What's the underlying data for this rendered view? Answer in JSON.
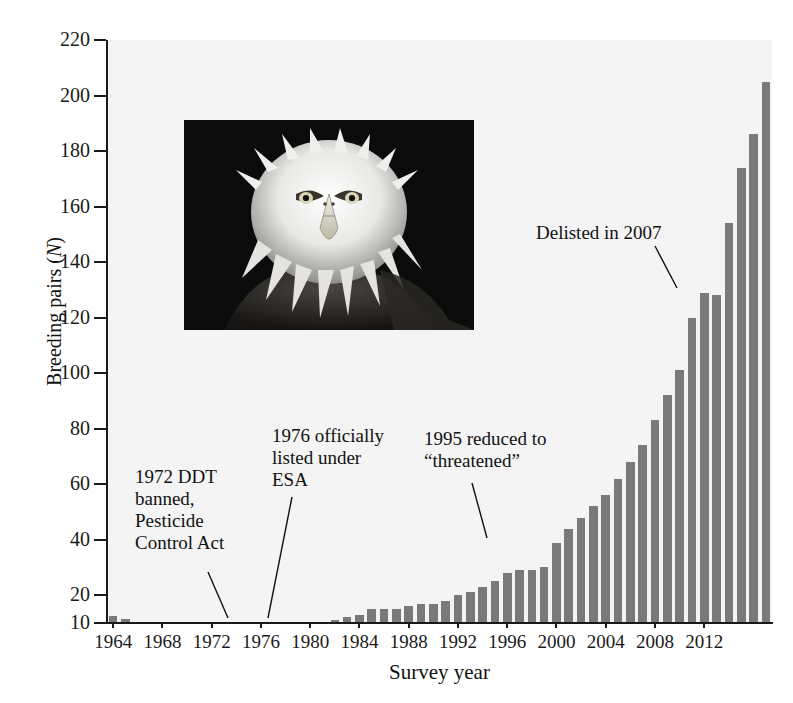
{
  "figure": {
    "alt_title": "Bald eagle breeding pairs by survey year",
    "bar_color": "#7a7a7a",
    "plot_background": "#f4f4f4",
    "axis_color": "#1a1a1a"
  },
  "chart_data": {
    "type": "bar",
    "title": "",
    "xlabel": "Survey year",
    "ylabel": "Breeding pairs (N)",
    "ylim": [
      10,
      220
    ],
    "ytick_labels": [
      "10",
      "20",
      "40",
      "60",
      "80",
      "100",
      "120",
      "140",
      "160",
      "180",
      "200",
      "220"
    ],
    "yticks": [
      10,
      20,
      40,
      60,
      80,
      100,
      120,
      140,
      160,
      180,
      200,
      220
    ],
    "xtick_labels": [
      "1964",
      "1968",
      "1972",
      "1976",
      "1980",
      "1984",
      "1988",
      "1992",
      "1996",
      "2000",
      "2004",
      "2008",
      "2012"
    ],
    "xticks": [
      1964,
      1968,
      1972,
      1976,
      1980,
      1984,
      1988,
      1992,
      1996,
      2000,
      2004,
      2008,
      2012
    ],
    "grid": false,
    "legend": "none",
    "categories": [
      1964,
      1965,
      1966,
      1967,
      1968,
      1969,
      1970,
      1971,
      1972,
      1973,
      1974,
      1975,
      1976,
      1977,
      1978,
      1979,
      1980,
      1981,
      1982,
      1983,
      1984,
      1985,
      1986,
      1987,
      1988,
      1989,
      1990,
      1991,
      1992,
      1993,
      1994,
      1995,
      1996,
      1997,
      1998,
      1999,
      2000,
      2001,
      2002,
      2003,
      2004,
      2005,
      2006,
      2007,
      2008,
      2009,
      2010,
      2011,
      2012,
      2013
    ],
    "values": [
      12.5,
      11.5,
      10.5,
      10,
      10,
      10,
      10,
      10,
      10,
      10,
      10,
      10,
      10,
      10,
      10,
      10,
      10,
      10.5,
      11,
      12,
      13,
      15,
      15,
      15,
      16,
      17,
      17,
      18,
      20,
      21,
      23,
      25,
      28,
      29,
      29,
      30,
      39,
      44,
      48,
      52,
      56,
      62,
      68,
      74,
      83,
      92,
      101,
      120,
      129,
      128
    ],
    "annotations": [
      {
        "id": "ddt-ban",
        "text": "1972 DDT\nbanned,\nPesticide\nControl Act",
        "points_to_year": 1972
      },
      {
        "id": "esa-listing",
        "text": "1976 officially\nlisted under\nESA",
        "points_to_year": 1976
      },
      {
        "id": "threatened",
        "text": "1995 reduced to\n“threatened”",
        "points_to_year": 1995
      },
      {
        "id": "delisted",
        "text": "Delisted in 2007",
        "points_to_year": 2007
      }
    ],
    "inset_image": {
      "name": "bald-eagle-photo",
      "caption": ""
    }
  },
  "chart_series_full": {
    "note": "Bar heights read off the axis (units = breeding pairs, N).",
    "pairs": [
      {
        "year": 1964,
        "value": 12.5
      },
      {
        "year": 1965,
        "value": 11.5
      },
      {
        "year": 1966,
        "value": 10.5
      },
      {
        "year": 1967,
        "value": 10.2
      },
      {
        "year": 1968,
        "value": 10.2
      },
      {
        "year": 1969,
        "value": 10.2
      },
      {
        "year": 1970,
        "value": 10.1
      },
      {
        "year": 1971,
        "value": 10.0
      },
      {
        "year": 1972,
        "value": 10.0
      },
      {
        "year": 1973,
        "value": 10.0
      },
      {
        "year": 1974,
        "value": 10.0
      },
      {
        "year": 1975,
        "value": 10.0
      },
      {
        "year": 1976,
        "value": 10.0
      },
      {
        "year": 1977,
        "value": 10.0
      },
      {
        "year": 1978,
        "value": 10.0
      },
      {
        "year": 1979,
        "value": 10.0
      },
      {
        "year": 1980,
        "value": 10.2
      },
      {
        "year": 1981,
        "value": 10.6
      },
      {
        "year": 1982,
        "value": 11.5
      },
      {
        "year": 1983,
        "value": 12.5
      },
      {
        "year": 1984,
        "value": 13.5
      },
      {
        "year": 1985,
        "value": 15.0
      },
      {
        "year": 1986,
        "value": 15.0
      },
      {
        "year": 1987,
        "value": 15.0
      },
      {
        "year": 1988,
        "value": 16.5
      },
      {
        "year": 1989,
        "value": 17.0
      },
      {
        "year": 1990,
        "value": 17.5
      },
      {
        "year": 1991,
        "value": 18.5
      },
      {
        "year": 1992,
        "value": 20.5
      },
      {
        "year": 1993,
        "value": 21.5
      },
      {
        "year": 1994,
        "value": 23.5
      },
      {
        "year": 1995,
        "value": 25.0
      },
      {
        "year": 1996,
        "value": 28.0
      },
      {
        "year": 1997,
        "value": 29.0
      },
      {
        "year": 1998,
        "value": 29.0
      },
      {
        "year": 1999,
        "value": 30.0
      },
      {
        "year": 2000,
        "value": 39.0
      },
      {
        "year": 2001,
        "value": 44.0
      },
      {
        "year": 2002,
        "value": 48.0
      },
      {
        "year": 2003,
        "value": 52.0
      },
      {
        "year": 2004,
        "value": 56.0
      },
      {
        "year": 2005,
        "value": 62.0
      },
      {
        "year": 2006,
        "value": 68.0
      },
      {
        "year": 2007,
        "value": 74.0
      },
      {
        "year": 2008,
        "value": 83.0
      },
      {
        "year": 2009,
        "value": 92.0
      },
      {
        "year": 2010,
        "value": 101.0
      },
      {
        "year": 2011,
        "value": 120.0
      },
      {
        "year": 2012,
        "value": 129.0
      },
      {
        "year": 2013,
        "value": 128.0
      }
    ]
  },
  "extra_bars_right": [
    154,
    174,
    186,
    205
  ]
}
